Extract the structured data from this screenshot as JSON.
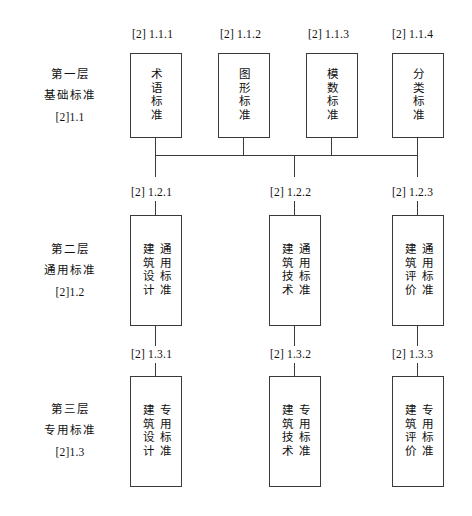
{
  "diagram": {
    "line_color": "#3a3a3a",
    "background": "#ffffff"
  },
  "row_labels": [
    {
      "id": "tier-1",
      "line1": "第一层",
      "line2": "基础标准",
      "code": "[2]1.1"
    },
    {
      "id": "tier-2",
      "line1": "第二层",
      "line2": "通用标准",
      "code": "[2]1.2"
    },
    {
      "id": "tier-3",
      "line1": "第三层",
      "line2": "专用标准",
      "code": "[2]1.3"
    }
  ],
  "tier1": {
    "nodes": [
      {
        "code": "[2] 1.1.1",
        "primary": "术语标准",
        "secondary": ""
      },
      {
        "code": "[2] 1.1.2",
        "primary": "图形标准",
        "secondary": ""
      },
      {
        "code": "[2] 1.1.3",
        "primary": "模数标准",
        "secondary": ""
      },
      {
        "code": "[2] 1.1.4",
        "primary": "分类标准",
        "secondary": ""
      }
    ]
  },
  "tier2": {
    "nodes": [
      {
        "code": "[2] 1.2.1",
        "primary": "通用标准",
        "secondary": "建筑设计"
      },
      {
        "code": "[2] 1.2.2",
        "primary": "通用标准",
        "secondary": "建筑技术"
      },
      {
        "code": "[2] 1.2.3",
        "primary": "通用标准",
        "secondary": "建筑评价"
      }
    ]
  },
  "tier3": {
    "nodes": [
      {
        "code": "[2] 1.3.1",
        "primary": "专用标准",
        "secondary": "建筑设计"
      },
      {
        "code": "[2] 1.3.2",
        "primary": "专用标准",
        "secondary": "建筑技术"
      },
      {
        "code": "[2] 1.3.3",
        "primary": "专用标准",
        "secondary": "建筑评价"
      }
    ]
  }
}
